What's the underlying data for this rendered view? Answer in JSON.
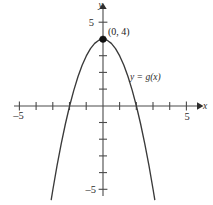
{
  "figure": {
    "background_color": "#ffffff",
    "curve_color": "#3a3a3a",
    "axis_color": "#4a4a4a",
    "point_color": "#111111"
  },
  "axes": {
    "x_axis_label": "x",
    "y_axis_label": "y",
    "x_tick_label_left": "–5",
    "x_tick_label_right": "5",
    "y_tick_label_top": "5",
    "y_tick_label_bottom": "–5",
    "x_min": -5,
    "x_max": 5,
    "y_min": -5,
    "y_max": 5,
    "x_ticks": [
      -5,
      -4,
      -3,
      -2,
      -1,
      1,
      2,
      3,
      4,
      5
    ],
    "y_ticks": [
      -5,
      -4,
      -3,
      -2,
      -1,
      1,
      2,
      3,
      4,
      5
    ],
    "grid": false
  },
  "annotations": {
    "vertex_label": "(0, 4)",
    "curve_label": "y = g(x)"
  },
  "chart_data": {
    "type": "line",
    "title": "",
    "xlabel": "x",
    "ylabel": "y",
    "xlim": [
      -5,
      5
    ],
    "ylim": [
      -5,
      5
    ],
    "grid": false,
    "legend": "y = g(x)",
    "series": [
      {
        "name": "y = g(x)",
        "equation": "y = 4 - x^2",
        "x": [
          -3.1,
          -3.0,
          -2.75,
          -2.5,
          -2.25,
          -2.0,
          -1.75,
          -1.5,
          -1.25,
          -1.0,
          -0.75,
          -0.5,
          -0.25,
          0,
          0.25,
          0.5,
          0.75,
          1.0,
          1.25,
          1.5,
          1.75,
          2.0,
          2.25,
          2.5,
          2.75,
          3.0,
          3.1
        ],
        "values": [
          -5.61,
          -5.0,
          -3.5625,
          -2.25,
          -1.0625,
          0,
          0.9375,
          1.75,
          2.4375,
          3.0,
          3.4375,
          3.75,
          3.9375,
          4.0,
          3.9375,
          3.75,
          3.4375,
          3.0,
          2.4375,
          1.75,
          0.9375,
          0,
          -1.0625,
          -2.25,
          -3.5625,
          -5.0,
          -5.61
        ]
      }
    ],
    "points": [
      {
        "label": "(0, 4)",
        "x": 0,
        "y": 4
      }
    ],
    "x_intercepts": [
      -2,
      2
    ],
    "y_intercept": 4,
    "vertex": {
      "x": 0,
      "y": 4
    }
  }
}
